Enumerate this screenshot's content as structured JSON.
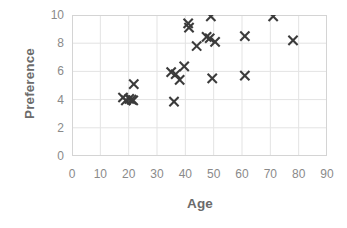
{
  "chart_data": {
    "type": "scatter",
    "title": "",
    "xlabel": "Age",
    "ylabel": "Preference",
    "xlim": [
      0,
      90
    ],
    "ylim": [
      0,
      10
    ],
    "xticks": [
      0,
      10,
      20,
      30,
      40,
      50,
      60,
      70,
      80,
      90
    ],
    "yticks": [
      0,
      2,
      4,
      6,
      8,
      10
    ],
    "grid": true,
    "legend": null,
    "marker": "x",
    "marker_color": "#3b3b3b",
    "axis_color": "#8a8a8a",
    "grid_color": "#e3e3e3",
    "label_color": "#6b6b6b",
    "points": [
      {
        "x": 18.0,
        "y": 4.15
      },
      {
        "x": 19.0,
        "y": 3.95
      },
      {
        "x": 20.2,
        "y": 4.05
      },
      {
        "x": 21.0,
        "y": 4.0
      },
      {
        "x": 21.6,
        "y": 3.95
      },
      {
        "x": 21.8,
        "y": 5.1
      },
      {
        "x": 36.0,
        "y": 3.85
      },
      {
        "x": 35.0,
        "y": 5.95
      },
      {
        "x": 36.6,
        "y": 5.8
      },
      {
        "x": 38.0,
        "y": 5.4
      },
      {
        "x": 39.6,
        "y": 6.35
      },
      {
        "x": 41.0,
        "y": 9.4
      },
      {
        "x": 41.3,
        "y": 9.1
      },
      {
        "x": 44.0,
        "y": 7.8
      },
      {
        "x": 47.5,
        "y": 8.45
      },
      {
        "x": 48.6,
        "y": 8.35
      },
      {
        "x": 49.0,
        "y": 9.9
      },
      {
        "x": 50.5,
        "y": 8.1
      },
      {
        "x": 49.5,
        "y": 5.5
      },
      {
        "x": 61.0,
        "y": 5.7
      },
      {
        "x": 61.0,
        "y": 8.5
      },
      {
        "x": 71.0,
        "y": 9.9
      },
      {
        "x": 78.0,
        "y": 8.2
      }
    ]
  }
}
